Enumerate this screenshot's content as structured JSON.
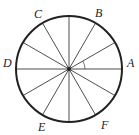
{
  "diagram": {
    "type": "circle-divided-into-sectors",
    "sectors": 12,
    "sector_angle_deg": 30,
    "center": {
      "x": 69,
      "y": 69
    },
    "radius": 53,
    "colors": {
      "stroke": "#222222",
      "background": "#ffffff"
    },
    "labels": [
      {
        "text": "A",
        "x": 127,
        "y": 67
      },
      {
        "text": "B",
        "x": 95,
        "y": 17
      },
      {
        "text": "C",
        "x": 34,
        "y": 18
      },
      {
        "text": "D",
        "x": 3,
        "y": 67
      },
      {
        "text": "E",
        "x": 38,
        "y": 131
      },
      {
        "text": "F",
        "x": 101,
        "y": 129
      }
    ],
    "angle_marker": {
      "between": "OA and 30° ray",
      "present": true
    }
  }
}
